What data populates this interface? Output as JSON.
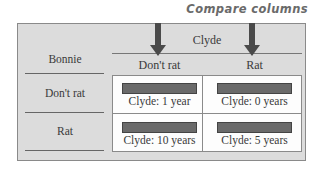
{
  "title": "Compare columns",
  "columns": {
    "group_label": "Clyde",
    "headers": [
      "Don't rat",
      "Rat"
    ]
  },
  "rows": {
    "group_label": "Bonnie",
    "headers": [
      "Don't rat",
      "Rat"
    ]
  },
  "cells": [
    [
      "Clyde: 1 year",
      "Clyde: 0 years"
    ],
    [
      "Clyde: 10 years",
      "Clyde: 5 years"
    ]
  ],
  "colors": {
    "background": "#dcdcdc",
    "grid": "#fdfdfd",
    "bar": "#6a6a6a",
    "arrow": "#4a4a4a",
    "title": "#6a6a6a"
  },
  "icons": [
    "arrow-down-icon",
    "arrow-down-icon"
  ]
}
